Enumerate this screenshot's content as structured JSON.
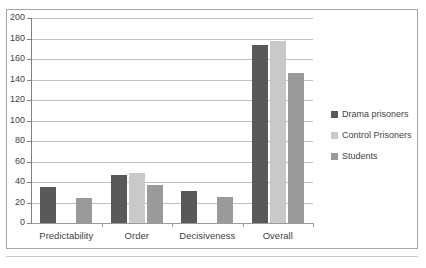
{
  "chart_data": {
    "type": "bar",
    "title": "",
    "subtitle": "",
    "xlabel": "",
    "ylabel": "",
    "ylim": [
      0,
      200
    ],
    "ytick_step": 20,
    "yticks": [
      0,
      20,
      40,
      60,
      80,
      100,
      120,
      140,
      160,
      180,
      200
    ],
    "ytick_labels": [
      "0",
      "20",
      "40",
      "60",
      "80",
      "100",
      "120",
      "140",
      "160",
      "180",
      "200"
    ],
    "categories": [
      "Predictability",
      "Order",
      "Decisiveness",
      "Overall"
    ],
    "grid": "horizontal",
    "legend_position": "right",
    "series": [
      {
        "name": "Drama prisoners",
        "color": "#595959",
        "values": [
          35,
          47,
          31,
          174
        ]
      },
      {
        "name": "Control Prisoners",
        "color": "#c9c9c9",
        "values": [
          null,
          49,
          null,
          178
        ]
      },
      {
        "name": "Students",
        "color": "#9a9a9a",
        "values": [
          24,
          37,
          25,
          146
        ]
      }
    ]
  },
  "legend": {
    "items": [
      {
        "label": "Drama prisoners",
        "color": "#595959",
        "swatch_name": "legend-swatch-drama-prisoners"
      },
      {
        "label": "Control Prisoners",
        "color": "#c9c9c9",
        "swatch_name": "legend-swatch-control-prisoners"
      },
      {
        "label": "Students",
        "color": "#9a9a9a",
        "swatch_name": "legend-swatch-students"
      }
    ]
  },
  "axes": {
    "y_axis_name": "value-axis",
    "x_axis_name": "category-axis"
  }
}
